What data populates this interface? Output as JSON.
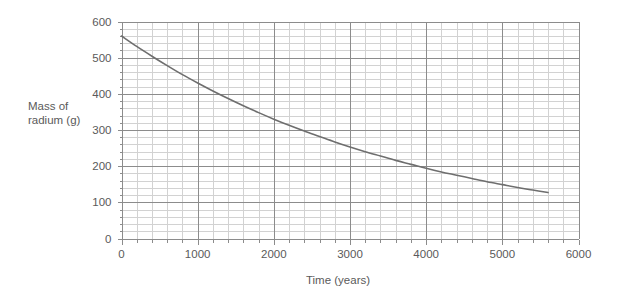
{
  "chart_data": {
    "type": "line",
    "title": "",
    "xlabel": "Time (years)",
    "ylabel": "Mass of radium (g)",
    "ylabel_line1": "Mass of",
    "ylabel_line2": "radium (g)",
    "xlim": [
      0,
      6000
    ],
    "ylim": [
      0,
      600
    ],
    "x_major_ticks": [
      0,
      1000,
      2000,
      3000,
      4000,
      5000,
      6000
    ],
    "x_tick_labels": [
      "0",
      "1000",
      "2000",
      "3000",
      "4000",
      "5000",
      "6000"
    ],
    "y_major_ticks": [
      0,
      100,
      200,
      300,
      400,
      500,
      600
    ],
    "y_tick_labels": [
      "0",
      "100",
      "200",
      "300",
      "400",
      "500",
      "600"
    ],
    "x_minor_step": 200,
    "y_minor_step": 20,
    "grid": true,
    "grid_major_color": "#8c8c8c",
    "grid_minor_color": "#d2d2d2",
    "axis_color": "#8c8c8c",
    "series": [
      {
        "name": "Mass of radium",
        "color": "#6e6e6e",
        "line_width": 1.6,
        "x": [
          0,
          200,
          400,
          600,
          800,
          1000,
          1200,
          1400,
          1600,
          1800,
          2000,
          2200,
          2400,
          2600,
          2800,
          3000,
          3200,
          3400,
          3600,
          3800,
          4000,
          4200,
          4400,
          4600,
          4800,
          5000,
          5200,
          5400,
          5600
        ],
        "y": [
          560,
          531,
          504,
          478,
          453,
          430,
          408,
          387,
          367,
          348,
          330,
          313,
          297,
          282,
          267,
          253,
          240,
          228,
          216,
          205,
          194,
          184,
          175,
          166,
          157,
          149,
          141,
          134,
          127
        ]
      }
    ],
    "legend": null,
    "legend_position": "none"
  }
}
